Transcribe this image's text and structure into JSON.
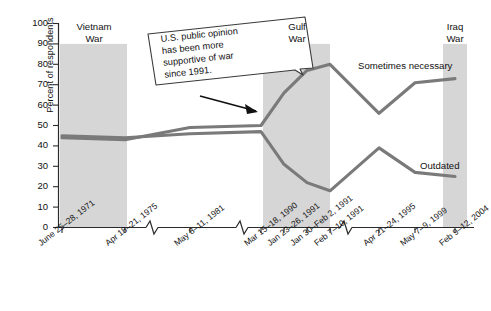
{
  "chart_data": {
    "type": "line",
    "title": "",
    "subtitle": "",
    "xlabel": "",
    "ylabel": "Percent of respondents",
    "ylim": [
      0,
      100
    ],
    "ytick_values": [
      0,
      10,
      20,
      30,
      40,
      50,
      60,
      70,
      80,
      90,
      100
    ],
    "grid": false,
    "legend_position": "inline-right",
    "axis_break": true,
    "categories": [
      "June 25–28, 1971",
      "Apr 18–21, 1975",
      "May 8–11, 1981",
      "Mar 15–18, 1990",
      "Jan 23–26, 1991",
      "Jan 30–Feb 2, 1991",
      "Feb 7–10, 1991",
      "Apr 21–24, 1995",
      "May 7–9, 1999",
      "Feb 9–12, 2004"
    ],
    "series": [
      {
        "name": "Sometimes necessary",
        "color": "#7a7a7a",
        "values": [
          44,
          43,
          49,
          50,
          66,
          77,
          80,
          56,
          71,
          73
        ]
      },
      {
        "name": "Outdated",
        "color": "#7a7a7a",
        "values": [
          45,
          44,
          46,
          47,
          31,
          22,
          18,
          39,
          27,
          25
        ]
      }
    ],
    "shaded_bands": [
      {
        "label_line1": "Vietnam",
        "label_line2": "War",
        "start_category": "June 25–28, 1971",
        "end_category": "Apr 18–21, 1975",
        "color": "#d6d6d6",
        "top_value": 90
      },
      {
        "label_line1": "Gulf",
        "label_line2": "War",
        "start_category": "Jan 23–26, 1991",
        "end_category": "Feb 7–10, 1991",
        "color": "#d6d6d6",
        "top_value": 90
      },
      {
        "label_line1": "Iraq",
        "label_line2": "War",
        "start_category": "Feb 9–12, 2004",
        "end_category": "Feb 9–12, 2004",
        "color": "#d6d6d6",
        "top_value": 90
      }
    ],
    "annotations": [
      {
        "name": "callout-box",
        "lines": [
          "U.S. public opinion",
          "has been more",
          "supportive of war",
          "since 1991."
        ],
        "points_to_category": "Jan 23–26, 1991"
      }
    ]
  },
  "ylabel": "Percent of respondents",
  "yticks": {
    "t0": "0",
    "t1": "10",
    "t2": "20",
    "t3": "30",
    "t4": "40",
    "t5": "50",
    "t6": "60",
    "t7": "70",
    "t8": "80",
    "t9": "90",
    "t10": "100"
  },
  "xticks": {
    "x0": "June 25–28, 1971",
    "x1": "Apr 18–21, 1975",
    "x2": "May 8–11, 1981",
    "x3": "Mar 15–18, 1990",
    "x4": "Jan 23–26, 1991",
    "x5": "Jan 30–Feb 2, 1991",
    "x6": "Feb 7–10, 1991",
    "x7": "Apr 21–24, 1995",
    "x8": "May 7–9, 1999",
    "x9": "Feb 9–12, 2004"
  },
  "bands": {
    "vietnam_l1": "Vietnam",
    "vietnam_l2": "War",
    "gulf_l1": "Gulf",
    "gulf_l2": "War",
    "iraq_l1": "Iraq",
    "iraq_l2": "War"
  },
  "series_labels": {
    "sometimes_necessary": "Sometimes necessary",
    "outdated": "Outdated"
  },
  "callout": {
    "line1": "U.S. public opinion",
    "line2": "has been more",
    "line3": "supportive of war",
    "line4": "since 1991."
  }
}
